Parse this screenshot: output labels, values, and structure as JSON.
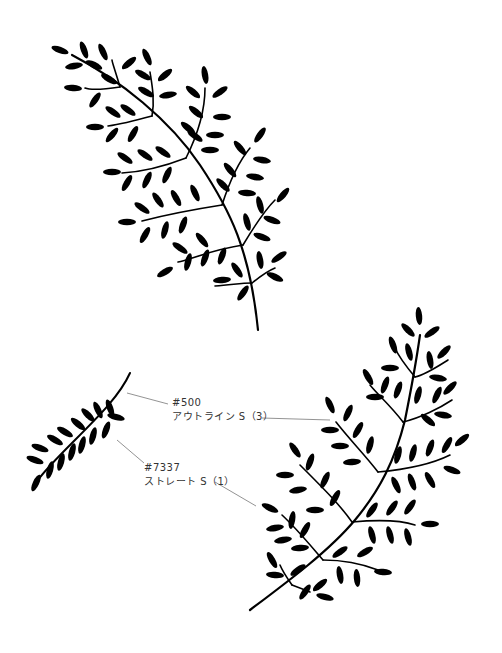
{
  "annotations": [
    {
      "code": "#500",
      "brush": "アウトライン S（3）"
    },
    {
      "code": "#7337",
      "brush": "ストレート S（1）"
    }
  ],
  "figures": [
    {
      "name": "fern-large-top",
      "description": "fern sprig, filled leaves"
    },
    {
      "name": "fern-small-left",
      "description": "small sprig drawn with brush #7337 Straight S (1)"
    },
    {
      "name": "fern-large-bottom",
      "description": "fern sprig drawn with brush #500 Outline S (3)"
    }
  ],
  "colors": {
    "ink": "#000000",
    "leader": "#777777",
    "label": "#333333",
    "background": "#ffffff"
  }
}
